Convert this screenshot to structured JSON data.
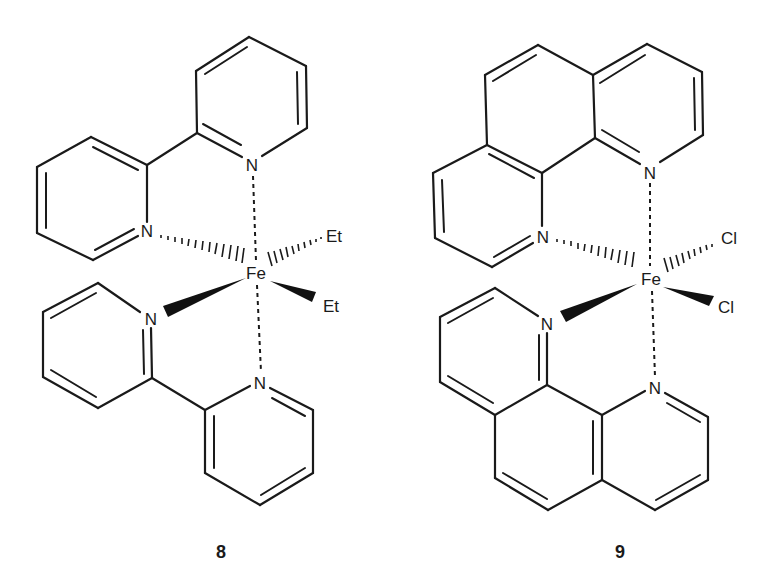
{
  "figure": {
    "type": "chemical-structures",
    "compounds": [
      {
        "id": "8",
        "label": "8",
        "metal": "Fe",
        "ligands": [
          "2,2'-bipyridine",
          "2,2'-bipyridine",
          "Et",
          "Et"
        ],
        "atom_labels": {
          "metal": "Fe",
          "n_top": "N",
          "n_left_upper": "N",
          "n_left_lower": "N",
          "n_bottom": "N",
          "x_upper": "Et",
          "x_lower": "Et"
        }
      },
      {
        "id": "9",
        "label": "9",
        "metal": "Fe",
        "ligands": [
          "1,10-phenanthroline",
          "1,10-phenanthroline",
          "Cl",
          "Cl"
        ],
        "atom_labels": {
          "metal": "Fe",
          "n_top": "N",
          "n_left_upper": "N",
          "n_left_lower": "N",
          "n_bottom": "N",
          "x_upper": "Cl",
          "x_lower": "Cl"
        }
      }
    ],
    "colors": {
      "ink": "#1a1a1a",
      "background": "#ffffff"
    }
  }
}
